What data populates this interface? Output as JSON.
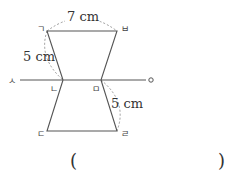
{
  "diagram": {
    "vertices": {
      "g": "ㄱ",
      "n": "ㄴ",
      "d": "ㄷ",
      "r": "ㄹ",
      "m": "ㅁ",
      "b": "ㅂ",
      "s": "ㅅ",
      "o": "ㅇ"
    },
    "measurements": {
      "top_length": "7 cm",
      "upper_left_side": "5 cm",
      "lower_right_side": "5 cm"
    }
  },
  "answer": {
    "open_paren": "(",
    "close_paren": ")"
  }
}
